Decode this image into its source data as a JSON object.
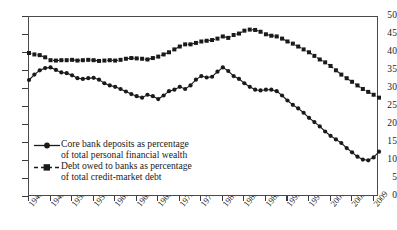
{
  "chart_data": {
    "type": "line",
    "title": "",
    "subtitle": "",
    "xlabel": "",
    "ylabel": "",
    "xlim": [
      1945,
      2010
    ],
    "ylim": [
      0,
      50
    ],
    "ytick_values": [
      0,
      5,
      10,
      15,
      20,
      25,
      30,
      35,
      40,
      45,
      50
    ],
    "xtick_labels": [
      "1945",
      "1949",
      "1953",
      "1957",
      "1961",
      "1965",
      "1969",
      "1973",
      "1977",
      "1981",
      "1985",
      "1989",
      "1993",
      "1997",
      "2001",
      "2005",
      "2009"
    ],
    "xtick_values": [
      1945,
      1949,
      1953,
      1957,
      1961,
      1965,
      1969,
      1973,
      1977,
      1981,
      1985,
      1989,
      1993,
      1997,
      2001,
      2005,
      2009
    ],
    "grid": false,
    "legend_position": "lower-left-inside",
    "x": [
      1945,
      1946,
      1947,
      1948,
      1949,
      1950,
      1951,
      1952,
      1953,
      1954,
      1955,
      1956,
      1957,
      1958,
      1959,
      1960,
      1961,
      1962,
      1963,
      1964,
      1965,
      1966,
      1967,
      1968,
      1969,
      1970,
      1971,
      1972,
      1973,
      1974,
      1975,
      1976,
      1977,
      1978,
      1979,
      1980,
      1981,
      1982,
      1983,
      1984,
      1985,
      1986,
      1987,
      1988,
      1989,
      1990,
      1991,
      1992,
      1993,
      1994,
      1995,
      1996,
      1997,
      1998,
      1999,
      2000,
      2001,
      2002,
      2003,
      2004,
      2005,
      2006,
      2007,
      2008,
      2009,
      2010
    ],
    "series": [
      {
        "name": "Core bank deposits as percentage of total personal financial wealth",
        "marker": "circle",
        "line_style": "solid",
        "color": "#1a1a1a",
        "values": [
          32.5,
          34.0,
          35.2,
          35.8,
          36.0,
          35.3,
          34.6,
          34.4,
          33.8,
          33.0,
          32.8,
          33.0,
          33.1,
          32.6,
          31.6,
          31.0,
          30.6,
          30.0,
          29.3,
          28.6,
          28.0,
          27.6,
          28.4,
          28.0,
          27.2,
          28.2,
          29.4,
          29.8,
          30.6,
          30.0,
          31.0,
          32.6,
          33.6,
          33.2,
          33.4,
          34.8,
          36.0,
          35.0,
          33.6,
          32.8,
          31.6,
          30.6,
          29.8,
          29.6,
          29.8,
          29.8,
          29.4,
          28.2,
          26.8,
          25.6,
          24.6,
          23.4,
          22.0,
          20.8,
          19.6,
          18.2,
          17.0,
          16.0,
          15.0,
          13.6,
          12.4,
          11.2,
          10.4,
          10.2,
          11.0,
          12.6
        ]
      },
      {
        "name": "Debt owed to banks as percentage of total credit-market debt",
        "marker": "square",
        "line_style": "dashed",
        "color": "#1a1a1a",
        "values": [
          40.0,
          39.6,
          39.4,
          38.8,
          38.0,
          37.9,
          38.0,
          38.0,
          38.1,
          37.9,
          38.0,
          38.1,
          38.0,
          37.8,
          37.9,
          38.0,
          37.9,
          38.1,
          38.4,
          38.6,
          38.5,
          38.4,
          38.2,
          38.6,
          39.0,
          39.6,
          40.2,
          41.0,
          41.8,
          42.4,
          42.4,
          42.8,
          43.2,
          43.4,
          43.6,
          44.0,
          44.6,
          44.2,
          45.0,
          45.4,
          46.2,
          46.5,
          46.4,
          45.9,
          45.2,
          44.8,
          44.6,
          44.0,
          43.2,
          42.6,
          41.8,
          41.0,
          40.2,
          39.2,
          38.2,
          37.4,
          36.4,
          35.2,
          34.0,
          33.0,
          32.0,
          31.0,
          30.0,
          29.2,
          28.4,
          27.6
        ]
      }
    ]
  },
  "legend": {
    "entries": [
      {
        "line1": "Core bank deposits as percentage",
        "line2": "of total personal financial wealth"
      },
      {
        "line1": "Debt owed to banks as percentage",
        "line2": "of total credit-market debt"
      }
    ]
  }
}
